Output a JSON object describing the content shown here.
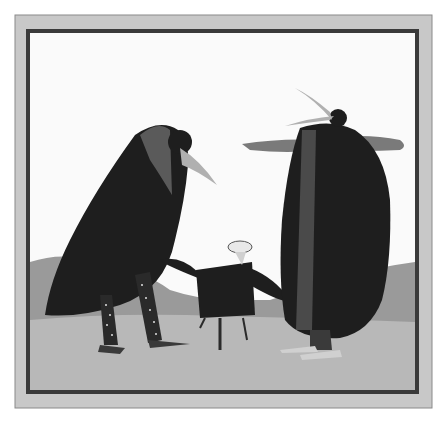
{
  "image": {
    "kind": "illustration",
    "description": "Framed grayscale watercolor illustration of two large crow-like figures in dark cloaks and a small cloaked figure between them on a hilly landscape",
    "colors": {
      "background": "#ffffff",
      "mat": "#c8c8c8",
      "frame_line": "#3a3a3a",
      "sky": "#fafafa",
      "hills": "#9a9a9a",
      "ground": "#b8b8b8",
      "cloak": "#1e1e1e",
      "beak": "#b0b0b0",
      "cloud": "#7a7a7a"
    },
    "figures": [
      {
        "name": "left-crow",
        "description": "large crow in black cloak with polka-dot trousers, beak pointing down-right"
      },
      {
        "name": "small-figure",
        "description": "small person in dark tunic with white cap, arms outstretched"
      },
      {
        "name": "right-crow",
        "description": "tall crow in long dark cloak with open beak pointing upward-left"
      }
    ]
  }
}
